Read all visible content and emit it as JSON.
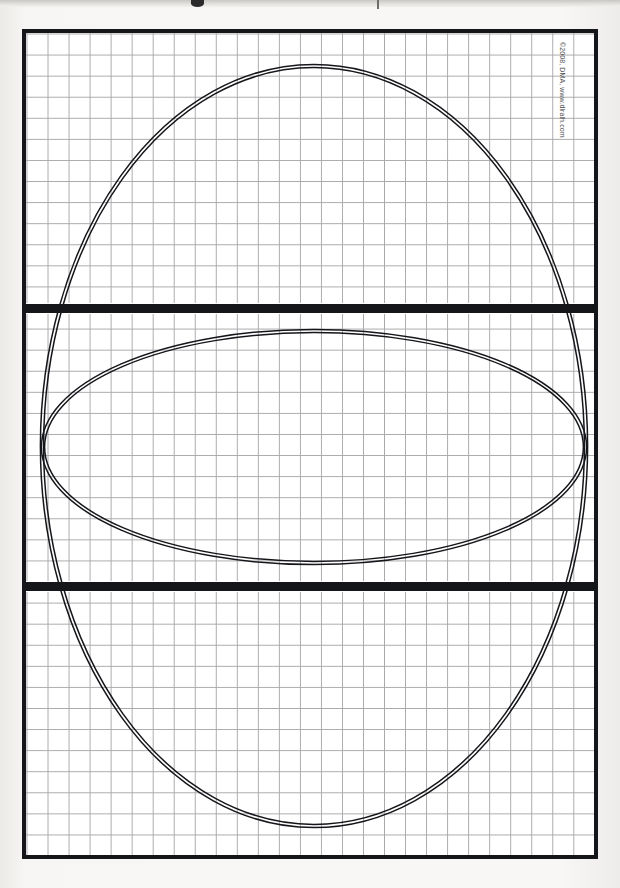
{
  "page": {
    "kind": "scanned-graph-paper-worksheet",
    "background_color": "#f6f5f3",
    "paper_color": "#ffffff",
    "ink_color": "#15161a",
    "grid_line_color": "#a9a9ab",
    "width": 620,
    "height": 888
  },
  "credit": {
    "text": "©2008, DMA, www.dlralh.com"
  },
  "frame": {
    "label": "worksheet-border",
    "x": 22,
    "y": 29,
    "width": 576,
    "height": 830,
    "border_width": 4
  },
  "grid": {
    "label": "graph-paper-grid",
    "cell_width": 21.04,
    "cell_height": 21.08,
    "columns": 27,
    "rows": 39,
    "line_color": "#a9a9ab"
  },
  "panels": [
    {
      "name": "top-panel",
      "top": 0,
      "height": 271
    },
    {
      "name": "middle-panel",
      "top": 280,
      "height": 269
    },
    {
      "name": "bottom-panel",
      "top": 558,
      "height": 264
    }
  ],
  "dividers": [
    {
      "name": "divider-upper",
      "top": 271,
      "height": 9
    },
    {
      "name": "divider-lower",
      "top": 549,
      "height": 9
    }
  ],
  "chart_data": {
    "type": "scatter",
    "title": "",
    "subtitle": "",
    "xlabel": "",
    "ylabel": "",
    "grid": true,
    "legend": "none",
    "xlim": [
      0,
      568
    ],
    "ylim": [
      0,
      822
    ],
    "series": [
      {
        "name": "large-circle",
        "shape": "circle",
        "cx": 288,
        "cy": 413,
        "rx": 272,
        "ry": 380,
        "stroke": "#15161a",
        "stroke_style": "double-line",
        "inner_gap": 3.2
      },
      {
        "name": "wide-ellipse",
        "shape": "ellipse",
        "cx": 288,
        "cy": 414,
        "rx": 271,
        "ry": 116,
        "stroke": "#15161a",
        "stroke_style": "double-line",
        "inner_gap": 3.2
      }
    ],
    "intersections": [
      {
        "x": 70,
        "y": 330
      },
      {
        "x": 506,
        "y": 330
      },
      {
        "x": 70,
        "y": 498
      },
      {
        "x": 506,
        "y": 498
      }
    ]
  }
}
